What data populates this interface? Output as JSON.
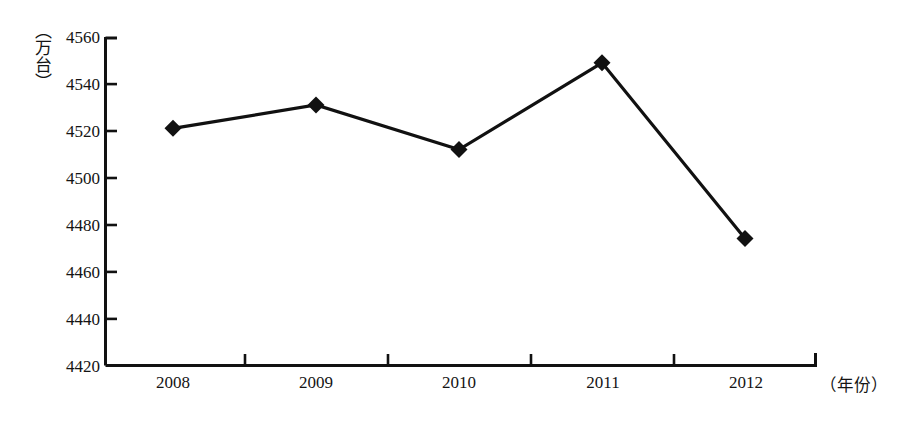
{
  "chart_data": {
    "type": "line",
    "title": "",
    "subtitle": "",
    "xlabel": "（年份）",
    "ylabel": "（万台）",
    "categories": [
      "2008",
      "2009",
      "2010",
      "2011",
      "2012"
    ],
    "values": [
      4521,
      4531,
      4512,
      4549,
      4474
    ],
    "series": [
      {
        "name": "",
        "values": [
          4521,
          4531,
          4512,
          4549,
          4474
        ]
      }
    ],
    "ylim": [
      4420,
      4560
    ],
    "yticks": [
      4420,
      4440,
      4460,
      4480,
      4500,
      4520,
      4540,
      4560
    ],
    "ytick_labels": [
      "4420",
      "4440",
      "4460",
      "4480",
      "4500",
      "4520",
      "4540",
      "4560"
    ],
    "xtick_labels": [
      "2008",
      "2009",
      "2010",
      "2011",
      "2012"
    ],
    "grid": false,
    "legend": null,
    "legend_position": "none",
    "marker": "diamond",
    "line_color": "#111111",
    "marker_color": "#111111",
    "axis_color": "#111111",
    "background_color": "#ffffff",
    "annotations": []
  },
  "axis": {
    "y_unit_label": "（万台）",
    "x_unit_label": "（年份）"
  }
}
